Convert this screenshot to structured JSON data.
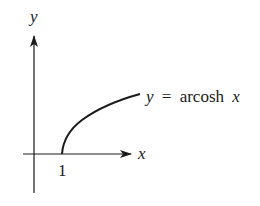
{
  "figure": {
    "axes": {
      "x_label": "x",
      "y_label": "y",
      "x_tick_label": "1"
    },
    "curve": {
      "function": "arcosh",
      "label_y": "y",
      "label_eq": "=",
      "label_fn": "arcosh",
      "label_x": "x"
    },
    "colors": {
      "stroke": "#1a1a1a",
      "background": "#ffffff"
    }
  }
}
